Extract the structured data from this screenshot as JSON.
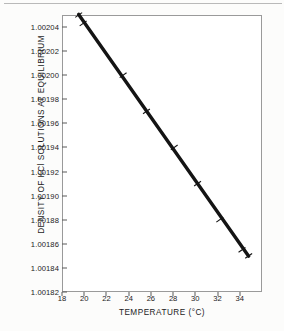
{
  "figure": {
    "kind": "scanned-scientific-figure",
    "paper_color": "#fcfcfb",
    "ink_color": "#1b1b1b",
    "frame_color": "#9a9a9a"
  },
  "chart_data": {
    "type": "scatter",
    "title": "",
    "xlabel": "TEMPERATURE (°C)",
    "ylabel": "DENSITY OF KCl SOLUTIONS AT EQUILIBRIUM",
    "xlim": [
      18,
      36
    ],
    "ylim": [
      1.00182,
      1.00205
    ],
    "grid": false,
    "legend": null,
    "xticks": [
      18,
      20,
      22,
      24,
      26,
      28,
      30,
      32,
      34
    ],
    "xticklabels": [
      "18",
      "20",
      "22",
      "24",
      "26",
      "28",
      "30",
      "32",
      "34"
    ],
    "yticks": [
      1.00182,
      1.00184,
      1.00186,
      1.00188,
      1.0019,
      1.00192,
      1.00194,
      1.00196,
      1.00198,
      1.002,
      1.00202,
      1.00204
    ],
    "yticklabels": [
      "1.00182",
      "1.00184",
      "1.00186",
      "1.00188",
      "1.00190",
      "1.00192",
      "1.00194",
      "1.00196",
      "1.00198",
      "1.00200",
      "1.00202",
      "1.00204"
    ],
    "series": [
      {
        "name": "density of KCl solutions at equilibrium",
        "marker": "error-bar-tick",
        "line": "solid-thick",
        "color": "#141414",
        "x": [
          19.5,
          19.9,
          23.5,
          25.6,
          28.1,
          30.2,
          32.2,
          34.2,
          34.8
        ],
        "y": [
          1.00205,
          1.002043,
          1.002,
          1.00197,
          1.00194,
          1.00191,
          1.00188,
          1.001855,
          1.00185
        ]
      }
    ],
    "fit_line": {
      "x_start": 19.5,
      "y_start": 1.0020505,
      "x_end": 34.8,
      "y_end": 1.0018497
    }
  }
}
